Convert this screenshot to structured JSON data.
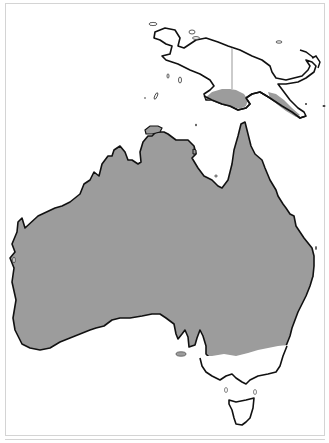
{
  "map": {
    "type": "distribution-map",
    "regions_shown": [
      "Australia",
      "New Guinea",
      "Tasmania"
    ],
    "colors": {
      "range_fill": "#9c9c9c",
      "land_fill": "#ffffff",
      "coastline": "#111111",
      "border_line": "#a8a8a8",
      "frame": "#d4d4d4"
    },
    "legend": []
  }
}
